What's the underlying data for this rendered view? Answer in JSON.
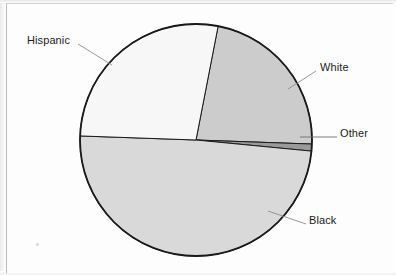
{
  "figure": {
    "type": "pie-chart",
    "background_color": "#fdfdfd",
    "border_color": "#b9b9b9",
    "outline_color": "#1a1a1a",
    "leader_line_color": "#8c8c8c"
  },
  "chart_data": {
    "type": "pie",
    "title": "",
    "labels": [
      "White",
      "Other",
      "Black",
      "Hispanic"
    ],
    "values": [
      22.5,
      1.0,
      49.0,
      27.5
    ],
    "units": "percent",
    "start_angle_deg": 11,
    "direction": "clockwise",
    "colors": [
      "#cccccc",
      "#9a9a9a",
      "#d9d9d9",
      "#f7f7f7"
    ],
    "legend": "none",
    "labels_position": "outside-with-leader-lines",
    "grid": false,
    "slices": [
      {
        "name": "White",
        "value": 22.5,
        "color": "#cccccc",
        "start_deg": 11,
        "end_deg": 92,
        "label": "White",
        "label_x": 320,
        "label_y": 67
      },
      {
        "name": "Other",
        "value": 1.0,
        "color": "#9a9a9a",
        "start_deg": 92,
        "end_deg": 95.5,
        "label": "Other",
        "label_x": 340,
        "label_y": 133
      },
      {
        "name": "Black",
        "value": 49.0,
        "color": "#d9d9d9",
        "start_deg": 95.5,
        "end_deg": 272,
        "label": "Black",
        "label_x": 309,
        "label_y": 220
      },
      {
        "name": "Hispanic",
        "value": 27.5,
        "color": "#f7f7f7",
        "start_deg": 272,
        "end_deg": 371,
        "label": "Hispanic",
        "label_x": 27,
        "label_y": 40
      }
    ],
    "geometry": {
      "center_x": 196,
      "center_y": 140,
      "radius": 116
    }
  }
}
